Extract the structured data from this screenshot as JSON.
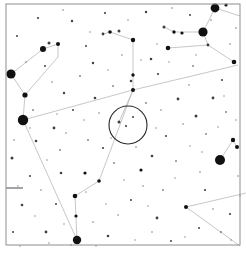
{
  "chart_data": {
    "type": "scatter",
    "title": "",
    "subtitle": "",
    "xlabel": "",
    "ylabel": "",
    "grid": false,
    "legend": null,
    "background_color": "#ffffff",
    "star_color": "#111111",
    "line_color": "#b9b9bd",
    "frame_color": "#8d8d93",
    "marker_circle_color": "#2a2a2e",
    "xlim": [
      0,
      246
    ],
    "ylim": [
      0,
      254
    ],
    "frame": {
      "x": 6,
      "y": 4,
      "width": 234,
      "height": 241
    },
    "field_marker": {
      "cx": 128,
      "cy": 125,
      "r": 19,
      "stroke_width": 1.1
    },
    "edge_tick": {
      "x1": 6,
      "y1": 188,
      "x2": 23,
      "y2": 188
    },
    "magnitude_scale_note": "radius in px encodes apparent brightness",
    "stars": [
      {
        "x": 11,
        "y": 74,
        "r": 4.6
      },
      {
        "x": 23,
        "y": 120,
        "r": 5.2
      },
      {
        "x": 215,
        "y": 8,
        "r": 4.4
      },
      {
        "x": 203,
        "y": 32,
        "r": 4.6
      },
      {
        "x": 220,
        "y": 160,
        "r": 5.0
      },
      {
        "x": 77,
        "y": 240,
        "r": 4.2
      },
      {
        "x": 43,
        "y": 49,
        "r": 3.0
      },
      {
        "x": 58,
        "y": 44,
        "r": 2.0
      },
      {
        "x": 49,
        "y": 43,
        "r": 1.5
      },
      {
        "x": 25,
        "y": 95,
        "r": 2.6
      },
      {
        "x": 174,
        "y": 32,
        "r": 1.7
      },
      {
        "x": 182,
        "y": 33,
        "r": 1.6
      },
      {
        "x": 164,
        "y": 27,
        "r": 1.5
      },
      {
        "x": 226,
        "y": 5,
        "r": 1.6
      },
      {
        "x": 208,
        "y": 45,
        "r": 1.4
      },
      {
        "x": 168,
        "y": 48,
        "r": 2.3
      },
      {
        "x": 233,
        "y": 140,
        "r": 2.2
      },
      {
        "x": 237,
        "y": 147,
        "r": 2.0
      },
      {
        "x": 234,
        "y": 62,
        "r": 2.3
      },
      {
        "x": 133,
        "y": 90,
        "r": 2.0
      },
      {
        "x": 133,
        "y": 40,
        "r": 2.2
      },
      {
        "x": 110,
        "y": 32,
        "r": 1.8
      },
      {
        "x": 119,
        "y": 31,
        "r": 1.5
      },
      {
        "x": 103,
        "y": 34,
        "r": 1.4
      },
      {
        "x": 133,
        "y": 75,
        "r": 1.7
      },
      {
        "x": 131,
        "y": 81,
        "r": 1.3
      },
      {
        "x": 75,
        "y": 196,
        "r": 2.3
      },
      {
        "x": 76,
        "y": 216,
        "r": 1.6
      },
      {
        "x": 99,
        "y": 181,
        "r": 1.8
      },
      {
        "x": 85,
        "y": 173,
        "r": 1.6
      },
      {
        "x": 186,
        "y": 207,
        "r": 2.0
      },
      {
        "x": 157,
        "y": 218,
        "r": 1.4
      },
      {
        "x": 12,
        "y": 158,
        "r": 1.5
      },
      {
        "x": 36,
        "y": 141,
        "r": 1.3
      },
      {
        "x": 54,
        "y": 128,
        "r": 1.4
      },
      {
        "x": 61,
        "y": 173,
        "r": 1.3
      },
      {
        "x": 22,
        "y": 205,
        "r": 1.3
      },
      {
        "x": 46,
        "y": 232,
        "r": 1.4
      },
      {
        "x": 108,
        "y": 236,
        "r": 1.3
      },
      {
        "x": 141,
        "y": 170,
        "r": 1.6
      },
      {
        "x": 152,
        "y": 156,
        "r": 1.3
      },
      {
        "x": 196,
        "y": 116,
        "r": 1.5
      },
      {
        "x": 213,
        "y": 98,
        "r": 1.4
      },
      {
        "x": 178,
        "y": 99,
        "r": 1.4
      },
      {
        "x": 95,
        "y": 98,
        "r": 1.3
      },
      {
        "x": 64,
        "y": 93,
        "r": 1.2
      },
      {
        "x": 93,
        "y": 63,
        "r": 1.2
      },
      {
        "x": 151,
        "y": 59,
        "r": 1.3
      },
      {
        "x": 119,
        "y": 122,
        "r": 1.5
      },
      {
        "x": 126,
        "y": 126,
        "r": 1.1
      },
      {
        "x": 133,
        "y": 117,
        "r": 1.0
      },
      {
        "x": 38,
        "y": 18,
        "r": 1.1
      },
      {
        "x": 72,
        "y": 21,
        "r": 1.2
      },
      {
        "x": 105,
        "y": 13,
        "r": 1.1
      },
      {
        "x": 146,
        "y": 12,
        "r": 1.2
      },
      {
        "x": 190,
        "y": 15,
        "r": 1.0
      },
      {
        "x": 17,
        "y": 36,
        "r": 1.0
      },
      {
        "x": 86,
        "y": 46,
        "r": 1.0
      },
      {
        "x": 158,
        "y": 74,
        "r": 1.1
      },
      {
        "x": 222,
        "y": 80,
        "r": 1.0
      },
      {
        "x": 45,
        "y": 66,
        "r": 1.0
      },
      {
        "x": 73,
        "y": 110,
        "r": 1.0
      },
      {
        "x": 103,
        "y": 148,
        "r": 1.1
      },
      {
        "x": 166,
        "y": 136,
        "r": 1.0
      },
      {
        "x": 205,
        "y": 190,
        "r": 1.1
      },
      {
        "x": 230,
        "y": 214,
        "r": 1.1
      },
      {
        "x": 171,
        "y": 241,
        "r": 1.0
      },
      {
        "x": 131,
        "y": 200,
        "r": 1.0
      },
      {
        "x": 56,
        "y": 204,
        "r": 1.0
      },
      {
        "x": 30,
        "y": 176,
        "r": 1.0
      },
      {
        "x": 13,
        "y": 232,
        "r": 1.0
      },
      {
        "x": 199,
        "y": 228,
        "r": 1.0
      },
      {
        "x": 221,
        "y": 232,
        "r": 0.9
      },
      {
        "x": 163,
        "y": 190,
        "r": 0.9
      },
      {
        "x": 114,
        "y": 163,
        "r": 0.9
      },
      {
        "x": 88,
        "y": 140,
        "r": 0.9
      },
      {
        "x": 60,
        "y": 150,
        "r": 0.9
      },
      {
        "x": 176,
        "y": 161,
        "r": 0.9
      },
      {
        "x": 206,
        "y": 134,
        "r": 0.9
      },
      {
        "x": 146,
        "y": 103,
        "r": 0.9
      },
      {
        "x": 113,
        "y": 86,
        "r": 0.9
      },
      {
        "x": 80,
        "y": 76,
        "r": 0.9
      },
      {
        "x": 33,
        "y": 110,
        "r": 0.9
      },
      {
        "x": 193,
        "y": 66,
        "r": 0.9
      },
      {
        "x": 226,
        "y": 112,
        "r": 0.9
      },
      {
        "x": 66,
        "y": 133,
        "r": 0.8
      },
      {
        "x": 122,
        "y": 55,
        "r": 0.8
      },
      {
        "x": 200,
        "y": 172,
        "r": 0.8
      },
      {
        "x": 152,
        "y": 232,
        "r": 0.8
      },
      {
        "x": 93,
        "y": 222,
        "r": 0.8
      },
      {
        "x": 41,
        "y": 190,
        "r": 0.8
      },
      {
        "x": 238,
        "y": 176,
        "r": 0.8
      },
      {
        "x": 183,
        "y": 124,
        "r": 0.8
      },
      {
        "x": 161,
        "y": 110,
        "r": 0.8
      },
      {
        "x": 99,
        "y": 113,
        "r": 0.8
      },
      {
        "x": 52,
        "y": 82,
        "r": 0.8
      },
      {
        "x": 136,
        "y": 147,
        "r": 0.8
      },
      {
        "x": 230,
        "y": 44,
        "r": 0.8
      },
      {
        "x": 189,
        "y": 85,
        "r": 0.8
      },
      {
        "x": 143,
        "y": 186,
        "r": 0.8
      },
      {
        "x": 71,
        "y": 245,
        "r": 0.8
      },
      {
        "x": 118,
        "y": 215,
        "r": 0.8
      },
      {
        "x": 213,
        "y": 209,
        "r": 0.8
      },
      {
        "x": 26,
        "y": 62,
        "r": 0.8
      },
      {
        "x": 63,
        "y": 10,
        "r": 0.8
      },
      {
        "x": 211,
        "y": 20,
        "r": 0.8
      },
      {
        "x": 172,
        "y": 8,
        "r": 0.8
      },
      {
        "x": 236,
        "y": 28,
        "r": 0.8
      },
      {
        "x": 14,
        "y": 140,
        "r": 0.8
      },
      {
        "x": 47,
        "y": 160,
        "r": 0.7
      },
      {
        "x": 124,
        "y": 180,
        "r": 0.7
      },
      {
        "x": 106,
        "y": 204,
        "r": 0.7
      },
      {
        "x": 190,
        "y": 146,
        "r": 0.7
      },
      {
        "x": 218,
        "y": 127,
        "r": 0.7
      },
      {
        "x": 156,
        "y": 128,
        "r": 0.7
      },
      {
        "x": 111,
        "y": 138,
        "r": 0.7
      },
      {
        "x": 84,
        "y": 120,
        "r": 0.7
      },
      {
        "x": 57,
        "y": 114,
        "r": 0.7
      },
      {
        "x": 30,
        "y": 128,
        "r": 0.7
      },
      {
        "x": 169,
        "y": 62,
        "r": 0.7
      },
      {
        "x": 141,
        "y": 60,
        "r": 0.7
      },
      {
        "x": 108,
        "y": 70,
        "r": 0.7
      },
      {
        "x": 90,
        "y": 32,
        "r": 0.7
      },
      {
        "x": 128,
        "y": 20,
        "r": 0.7
      },
      {
        "x": 157,
        "y": 44,
        "r": 0.7
      },
      {
        "x": 196,
        "y": 55,
        "r": 0.7
      },
      {
        "x": 224,
        "y": 96,
        "r": 0.7
      },
      {
        "x": 236,
        "y": 120,
        "r": 0.7
      },
      {
        "x": 202,
        "y": 152,
        "r": 0.7
      },
      {
        "x": 175,
        "y": 178,
        "r": 0.7
      },
      {
        "x": 148,
        "y": 206,
        "r": 0.7
      },
      {
        "x": 86,
        "y": 192,
        "r": 0.7
      },
      {
        "x": 64,
        "y": 224,
        "r": 0.7
      },
      {
        "x": 35,
        "y": 216,
        "r": 0.7
      },
      {
        "x": 18,
        "y": 186,
        "r": 0.7
      },
      {
        "x": 240,
        "y": 196,
        "r": 0.7
      },
      {
        "x": 231,
        "y": 240,
        "r": 0.7
      },
      {
        "x": 185,
        "y": 237,
        "r": 0.7
      },
      {
        "x": 135,
        "y": 240,
        "r": 0.7
      },
      {
        "x": 96,
        "y": 246,
        "r": 0.7
      },
      {
        "x": 49,
        "y": 243,
        "r": 0.7
      },
      {
        "x": 20,
        "y": 246,
        "r": 0.7
      }
    ],
    "constellation_lines": [
      {
        "x1": 11,
        "y1": 74,
        "x2": 43,
        "y2": 49
      },
      {
        "x1": 43,
        "y1": 49,
        "x2": 58,
        "y2": 44
      },
      {
        "x1": 58,
        "y1": 44,
        "x2": 58,
        "y2": 57
      },
      {
        "x1": 11,
        "y1": 74,
        "x2": 25,
        "y2": 95
      },
      {
        "x1": 25,
        "y1": 95,
        "x2": 23,
        "y2": 120
      },
      {
        "x1": 25,
        "y1": 95,
        "x2": 58,
        "y2": 57
      },
      {
        "x1": 23,
        "y1": 120,
        "x2": 133,
        "y2": 90
      },
      {
        "x1": 133,
        "y1": 90,
        "x2": 238,
        "y2": 65
      },
      {
        "x1": 133,
        "y1": 90,
        "x2": 133,
        "y2": 40
      },
      {
        "x1": 133,
        "y1": 40,
        "x2": 110,
        "y2": 32
      },
      {
        "x1": 110,
        "y1": 32,
        "x2": 103,
        "y2": 34
      },
      {
        "x1": 215,
        "y1": 8,
        "x2": 203,
        "y2": 32
      },
      {
        "x1": 215,
        "y1": 8,
        "x2": 240,
        "y2": 16
      },
      {
        "x1": 203,
        "y1": 32,
        "x2": 174,
        "y2": 32
      },
      {
        "x1": 174,
        "y1": 32,
        "x2": 164,
        "y2": 27
      },
      {
        "x1": 203,
        "y1": 32,
        "x2": 208,
        "y2": 45
      },
      {
        "x1": 208,
        "y1": 45,
        "x2": 168,
        "y2": 48
      },
      {
        "x1": 208,
        "y1": 45,
        "x2": 234,
        "y2": 62
      },
      {
        "x1": 220,
        "y1": 160,
        "x2": 233,
        "y2": 140
      },
      {
        "x1": 233,
        "y1": 140,
        "x2": 237,
        "y2": 147
      },
      {
        "x1": 186,
        "y1": 207,
        "x2": 246,
        "y2": 193
      },
      {
        "x1": 186,
        "y1": 207,
        "x2": 240,
        "y2": 246
      },
      {
        "x1": 77,
        "y1": 240,
        "x2": 75,
        "y2": 196
      },
      {
        "x1": 75,
        "y1": 196,
        "x2": 99,
        "y2": 181
      },
      {
        "x1": 99,
        "y1": 181,
        "x2": 133,
        "y2": 90
      },
      {
        "x1": 77,
        "y1": 240,
        "x2": 23,
        "y2": 120
      },
      {
        "x1": 133,
        "y1": 90,
        "x2": 119,
        "y2": 122
      }
    ]
  }
}
